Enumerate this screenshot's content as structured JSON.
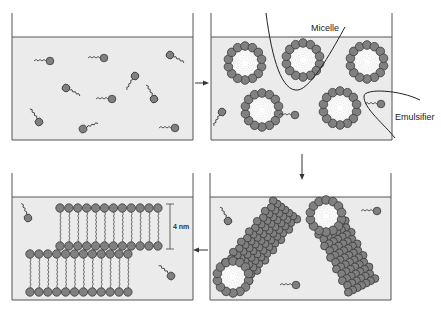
{
  "colors": {
    "liquid": "#ebebeb",
    "head_fill": "#808080",
    "head_stroke": "#3a3a3a",
    "line": "#333333",
    "background": "#ffffff"
  },
  "panels": [
    {
      "id": "free-emulsifier",
      "position": "top-left",
      "description": "Free emulsifier molecules dispersed in liquid"
    },
    {
      "id": "spherical-micelles",
      "position": "top-right",
      "description": "Spherical micelles with free emulsifiers"
    },
    {
      "id": "cylindrical-micelles",
      "position": "bottom-right",
      "description": "Rod-like cylindrical micelles"
    },
    {
      "id": "bilayers",
      "position": "bottom-left",
      "description": "Lamellar bilayer sheets"
    }
  ],
  "labels": {
    "micelle": "Micelle",
    "emulsifier": "Emulsifier",
    "bilayer_thickness": "4 nm"
  },
  "arrows": [
    {
      "from": "free-emulsifier",
      "to": "spherical-micelles",
      "direction": "right"
    },
    {
      "from": "spherical-micelles",
      "to": "cylindrical-micelles",
      "direction": "down"
    },
    {
      "from": "cylindrical-micelles",
      "to": "bilayers",
      "direction": "left"
    }
  ]
}
